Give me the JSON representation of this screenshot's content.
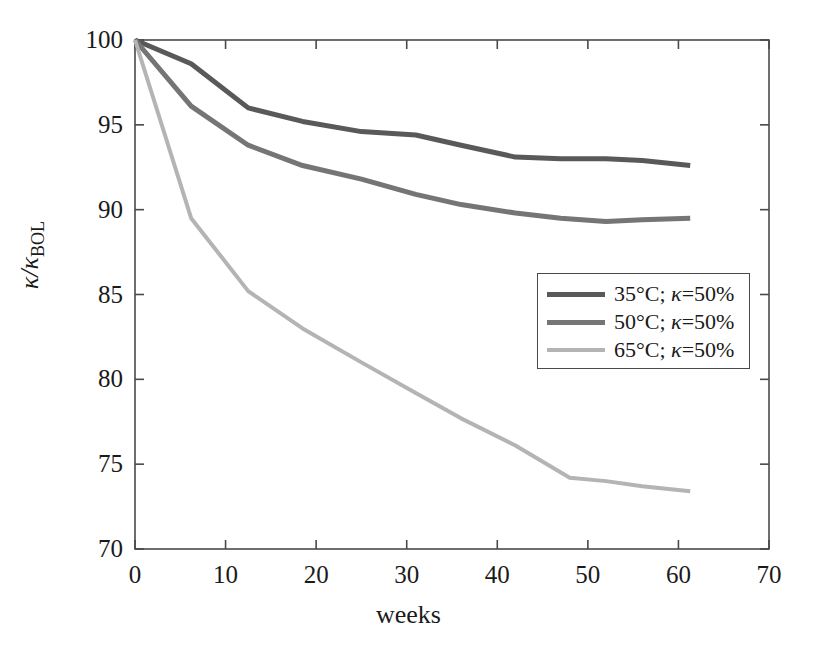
{
  "figure": {
    "background_color": "#ffffff",
    "axis_color": "#4a4a4a"
  },
  "axes": {
    "x_label": "weeks",
    "y_label_prefix": "κ/κ",
    "y_label_subscript": "BOL",
    "x_ticks": [
      "0",
      "10",
      "20",
      "30",
      "40",
      "50",
      "60",
      "70"
    ],
    "y_ticks": [
      "70",
      "75",
      "80",
      "85",
      "90",
      "95",
      "100"
    ]
  },
  "legend": {
    "entries": [
      {
        "label_temp": "35°C; ",
        "label_kappa": "κ",
        "label_rest": "=50%",
        "color": "#595959",
        "width": 5
      },
      {
        "label_temp": "50°C; ",
        "label_kappa": "κ",
        "label_rest": "=50%",
        "color": "#757575",
        "width": 5
      },
      {
        "label_temp": "65°C; ",
        "label_kappa": "κ",
        "label_rest": "=50%",
        "color": "#b4b4b4",
        "width": 4
      }
    ]
  },
  "chart_data": {
    "type": "line",
    "title": "",
    "xlabel": "weeks",
    "ylabel": "κ/κ_BOL",
    "xlim": [
      0,
      70
    ],
    "ylim": [
      70,
      100
    ],
    "xticks": [
      0,
      10,
      20,
      30,
      40,
      50,
      60,
      70
    ],
    "yticks": [
      70,
      75,
      80,
      85,
      90,
      95,
      100
    ],
    "grid": false,
    "legend_position": "center-right",
    "series": [
      {
        "name": "35°C; κ=50%",
        "color": "#595959",
        "linewidth": 5,
        "x": [
          0,
          6.2,
          12.5,
          18.5,
          25,
          31,
          36,
          42,
          47,
          52,
          56,
          61.3
        ],
        "y": [
          100,
          98.6,
          96.0,
          95.2,
          94.6,
          94.4,
          93.8,
          93.1,
          93.0,
          93.0,
          92.9,
          92.6
        ]
      },
      {
        "name": "50°C; κ=50%",
        "color": "#757575",
        "linewidth": 5,
        "x": [
          0,
          6.2,
          12.5,
          18.5,
          25,
          31,
          36,
          42,
          47,
          52,
          56,
          61.3
        ],
        "y": [
          100,
          96.1,
          93.8,
          92.6,
          91.8,
          90.9,
          90.3,
          89.8,
          89.5,
          89.3,
          89.4,
          89.5
        ]
      },
      {
        "name": "65°C; κ=50%",
        "color": "#b4b4b4",
        "linewidth": 4,
        "x": [
          0,
          6.2,
          12.5,
          18.5,
          25,
          31,
          36,
          42,
          48,
          52,
          56,
          61.3
        ],
        "y": [
          100,
          89.5,
          85.2,
          83.0,
          81.0,
          79.2,
          77.7,
          76.1,
          74.2,
          74.0,
          73.7,
          73.4
        ]
      }
    ]
  }
}
